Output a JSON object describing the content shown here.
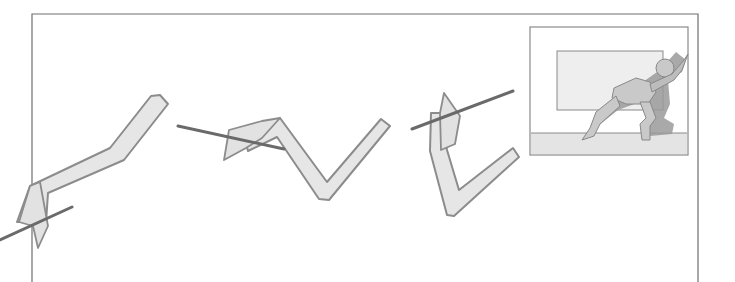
{
  "figure": {
    "colors": {
      "background": "#ffffff",
      "frame": "#6e6e6e",
      "limb_fill": "#e6e6e6",
      "limb_stroke": "#8c8c8c",
      "stick": "#6a6a6a",
      "inset_border": "#8a8a8a",
      "inset_panel": "#eeeeee",
      "inset_floor": "#e4e4e4",
      "figure_fill": "#c9c9c9",
      "shadow": "#9a9a9a"
    },
    "frame": {
      "left": 32,
      "top": 14,
      "right": 698,
      "bottom_open": true
    },
    "sketches": [
      {
        "label": "limb-pose-1",
        "position": "left"
      },
      {
        "label": "limb-pose-2",
        "position": "center-left"
      },
      {
        "label": "limb-pose-3",
        "position": "center-right"
      }
    ],
    "inset": {
      "label": "pushing-figure-inset",
      "box": {
        "x": 530,
        "y": 27,
        "w": 158,
        "h": 128
      },
      "wall_panel": {
        "x": 557,
        "y": 51,
        "w": 106,
        "h": 59
      },
      "floor_y": 133
    }
  }
}
